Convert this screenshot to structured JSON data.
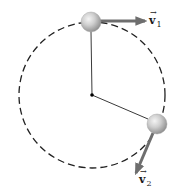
{
  "diagram": {
    "circle": {
      "cx": 92,
      "cy": 95,
      "r": 73,
      "style": "dashed",
      "color": "#222222"
    },
    "center_point": {
      "cx": 92,
      "cy": 95,
      "r": 1.8,
      "color": "#000000"
    },
    "balls": [
      {
        "id": "ball-1",
        "cx": 91,
        "cy": 22,
        "r": 10
      },
      {
        "id": "ball-2",
        "cx": 157,
        "cy": 124,
        "r": 10
      }
    ],
    "strings": [
      {
        "id": "string-1",
        "x1": 92,
        "y1": 95,
        "x2": 91,
        "y2": 32
      },
      {
        "id": "string-2",
        "x1": 92,
        "y1": 95,
        "x2": 148,
        "y2": 119
      }
    ],
    "vectors": [
      {
        "id": "v1",
        "label_main": "v",
        "label_sub": "1",
        "accent": "→",
        "from": [
          100,
          21
        ],
        "to": [
          147,
          21
        ]
      },
      {
        "id": "v2",
        "label_main": "v",
        "label_sub": "2",
        "accent": "→",
        "from": [
          153,
          133
        ],
        "to": [
          135,
          175
        ]
      }
    ],
    "colors": {
      "vector": "#6e6e6e",
      "string": "#3a3a3a",
      "ball_highlight": "#f2f2f2",
      "ball_mid": "#c4c4c4",
      "ball_shadow": "#8a8a8a"
    }
  }
}
